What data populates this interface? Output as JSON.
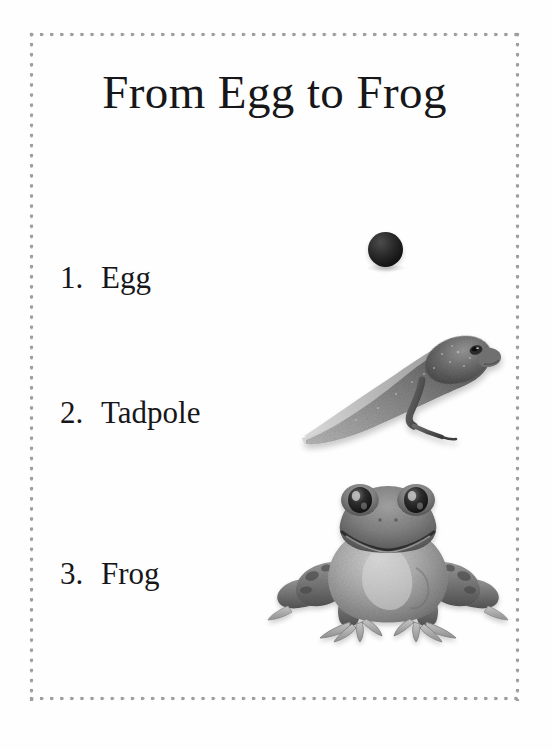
{
  "document": {
    "kind": "worksheet-page",
    "title": "From Egg to Frog",
    "background_color": "#fefefe",
    "border": {
      "style": "dotted",
      "color": "#9e9ea2"
    }
  },
  "stages": [
    {
      "number": "1.",
      "name": "Egg",
      "image": "frog-egg-photo",
      "image_description": "black round frog egg",
      "image_color": "#141414"
    },
    {
      "number": "2.",
      "name": "Tadpole",
      "image": "tadpole-photo",
      "image_description": "grayscale tadpole with one hind leg",
      "image_color": "#7b7b7b"
    },
    {
      "number": "3.",
      "name": "Frog",
      "image": "frog-photo",
      "image_description": "grayscale front-facing adult frog",
      "image_color": "#8a8a8a"
    }
  ]
}
